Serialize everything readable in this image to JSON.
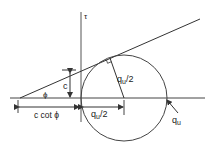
{
  "diagram": {
    "type": "mohr-coulomb-circle",
    "axis": {
      "vertical_label": "τ"
    },
    "labels": {
      "cohesion": "c",
      "friction_angle": "ϕ",
      "intercept_distance": "c cot ϕ",
      "radius_horizontal_q": "q",
      "radius_horizontal_sub": "u",
      "radius_horizontal_tail": "/2",
      "radius_slanted_q": "q",
      "radius_slanted_sub": "u",
      "radius_slanted_tail": "/2",
      "diameter_end_q": "q",
      "diameter_end_sub": "u"
    },
    "colors": {
      "line": "#333333",
      "text": "#222222",
      "background": "#ffffff"
    }
  }
}
